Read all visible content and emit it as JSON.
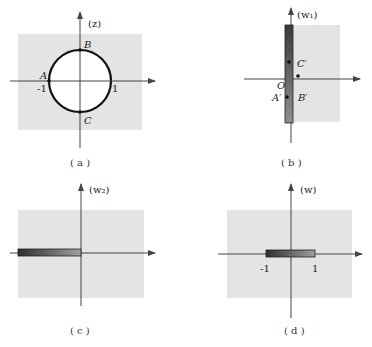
{
  "colors": {
    "region": "#e4e4e4",
    "axis": "#444444",
    "circle": "#111111",
    "bar_dark": "#3a3a3a",
    "bar_light": "#9a9a9a"
  },
  "panels": {
    "a": {
      "plane_label": "(z)",
      "caption": "( a )",
      "points": {
        "A": "A",
        "B": "B",
        "C": "C"
      },
      "ticks": {
        "neg_one": "-1",
        "one": "1"
      },
      "description": "unit circle |z|=1, exterior shaded"
    },
    "b": {
      "plane_label": "(w₁)",
      "caption": "( b )",
      "points": {
        "C": "C′",
        "A": "A′",
        "B": "B′",
        "origin": "O"
      },
      "description": "right half-plane shaded, slit along imaginary axis"
    },
    "c": {
      "plane_label": "(w₂)",
      "caption": "( c )",
      "description": "plane with slit along negative real axis"
    },
    "d": {
      "plane_label": "(w)",
      "caption": "( d )",
      "ticks": {
        "neg_one": "-1",
        "one": "1"
      },
      "description": "plane with slit on real segment [-1, 1]"
    }
  }
}
